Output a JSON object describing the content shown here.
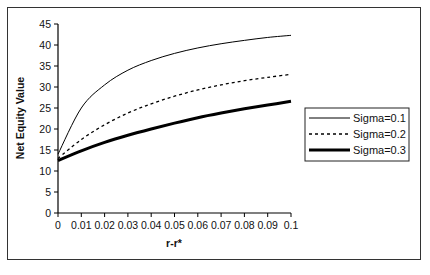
{
  "chart_data": {
    "type": "line",
    "title": "",
    "xlabel": "r-r*",
    "ylabel": "Net Equity Value",
    "x": [
      0,
      0.01,
      0.02,
      0.03,
      0.04,
      0.05,
      0.06,
      0.07,
      0.08,
      0.09,
      0.1
    ],
    "x_tick_labels": [
      "0",
      "0.01",
      "0.02",
      "0.03",
      "0.04",
      "0.05",
      "0.06",
      "0.07",
      "0.08",
      "0.09",
      "0.1"
    ],
    "y_tick_labels": [
      "0",
      "5",
      "10",
      "15",
      "20",
      "25",
      "30",
      "35",
      "40",
      "45"
    ],
    "xlim": [
      0,
      0.1
    ],
    "ylim": [
      0,
      45
    ],
    "grid": false,
    "legend_position": "right-inside",
    "series": [
      {
        "name": "Sigma=0.1",
        "style": "solid-thin",
        "values": [
          14,
          25,
          30.5,
          34,
          36.3,
          38,
          39.3,
          40.3,
          41.1,
          41.8,
          42.3
        ]
      },
      {
        "name": "Sigma=0.2",
        "style": "dashed",
        "values": [
          13,
          17.5,
          21,
          23.8,
          26,
          27.8,
          29.3,
          30.5,
          31.5,
          32.3,
          33
        ]
      },
      {
        "name": "Sigma=0.3",
        "style": "solid-thick",
        "values": [
          12.5,
          14.8,
          16.8,
          18.5,
          20,
          21.4,
          22.7,
          23.8,
          24.8,
          25.7,
          26.6
        ]
      }
    ]
  },
  "legend": {
    "items": [
      "Sigma=0.1",
      "Sigma=0.2",
      "Sigma=0.3"
    ]
  }
}
